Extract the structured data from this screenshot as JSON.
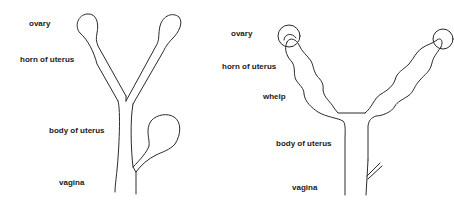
{
  "figures": [
    {
      "id": "non-pregnant",
      "labels": {
        "ovary": "ovary",
        "horn": "horn of uterus",
        "body": "body of uterus",
        "vagina": "vagina"
      }
    },
    {
      "id": "pregnant",
      "labels": {
        "ovary": "ovary",
        "horn": "horn of uterus",
        "whelp": "whelp",
        "body": "body of uterus",
        "vagina": "vagina"
      }
    }
  ],
  "colors": {
    "line": "#2a2a2a",
    "text": "#1a1a1a",
    "background": "#ffffff"
  }
}
